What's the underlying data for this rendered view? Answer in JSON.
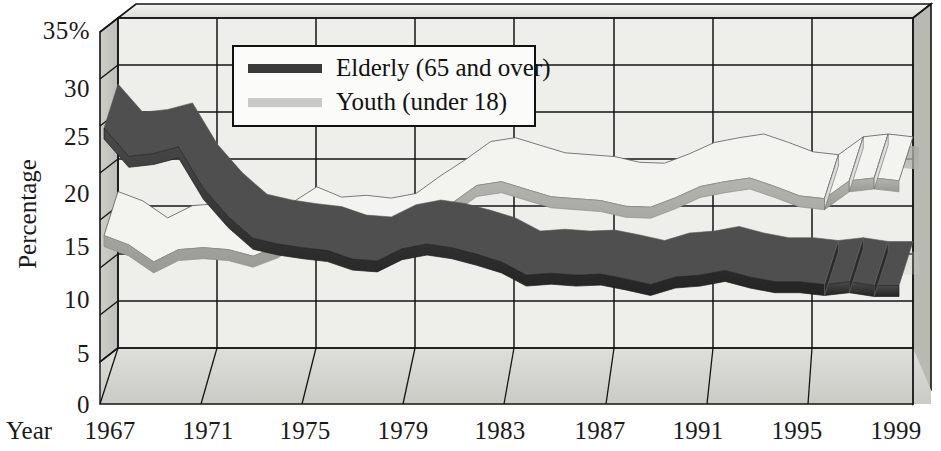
{
  "chart_data": {
    "type": "line",
    "title": "",
    "xlabel": "Year",
    "ylabel": "Percentage",
    "ylim": [
      0,
      35
    ],
    "yticks": [
      0,
      5,
      10,
      15,
      20,
      25,
      30,
      35
    ],
    "ytick_labels": [
      "0",
      "5",
      "10",
      "15",
      "20",
      "25",
      "30",
      "35%"
    ],
    "xlim": [
      1967,
      1999
    ],
    "xticks": [
      1967,
      1971,
      1975,
      1979,
      1983,
      1987,
      1991,
      1995,
      1999
    ],
    "xtick_labels": [
      "1967",
      "1971",
      "1975",
      "1979",
      "1983",
      "1987",
      "1991",
      "1995",
      "1999"
    ],
    "grid": true,
    "legend_position": "top-center",
    "style": "3d-perspective-ribbon",
    "projection_note": "Segmented (dashed) ribbon sections at the right end indicate projected values",
    "projection_starts_at": 1996,
    "series": [
      {
        "name": "Elderly (65 and over)",
        "color": "#3a3a3a",
        "x": [
          1967,
          1968,
          1969,
          1970,
          1971,
          1972,
          1973,
          1974,
          1975,
          1976,
          1977,
          1978,
          1979,
          1980,
          1981,
          1982,
          1983,
          1984,
          1985,
          1986,
          1987,
          1988,
          1989,
          1990,
          1991,
          1992,
          1993,
          1994,
          1995,
          1996,
          1997,
          1998,
          1999
        ],
        "values": [
          28.0,
          25.0,
          25.3,
          26.0,
          21.6,
          18.6,
          16.3,
          15.7,
          15.3,
          15.0,
          14.1,
          13.9,
          15.2,
          15.7,
          15.3,
          14.6,
          13.8,
          12.4,
          12.6,
          12.4,
          12.5,
          12.0,
          11.4,
          12.2,
          12.4,
          12.9,
          12.2,
          11.7,
          11.7,
          11.4,
          11.7,
          11.3,
          11.3
        ]
      },
      {
        "name": "Youth (under 18)",
        "color": "#c9c9c5",
        "x": [
          1967,
          1968,
          1969,
          1970,
          1971,
          1972,
          1973,
          1974,
          1975,
          1976,
          1977,
          1978,
          1979,
          1980,
          1981,
          1982,
          1983,
          1984,
          1985,
          1986,
          1987,
          1988,
          1989,
          1990,
          1991,
          1992,
          1993,
          1994,
          1995,
          1996,
          1997,
          1998,
          1999
        ],
        "values": [
          16.6,
          15.6,
          13.8,
          15.1,
          15.3,
          15.1,
          14.4,
          15.4,
          17.1,
          16.0,
          16.2,
          15.9,
          16.4,
          18.3,
          20.0,
          21.9,
          22.3,
          21.5,
          20.7,
          20.5,
          20.3,
          19.7,
          19.6,
          20.6,
          21.8,
          22.3,
          22.7,
          21.8,
          20.8,
          20.5,
          22.4,
          22.7,
          22.4
        ]
      }
    ]
  },
  "legend": {
    "items": [
      {
        "label": "Elderly (65 and over)",
        "color": "#3a3a3a"
      },
      {
        "label": "Youth (under 18)",
        "color": "#c9c9c5"
      }
    ]
  },
  "axes": {
    "y_title": "Percentage",
    "x_title": "Year"
  },
  "colors": {
    "elderly": "#3a3a3a",
    "youth": "#c9c9c5",
    "frame": "#141414",
    "floor": "#d6d6d2",
    "wall": "#e9e9e5",
    "backwall": "#f2f2ee"
  }
}
